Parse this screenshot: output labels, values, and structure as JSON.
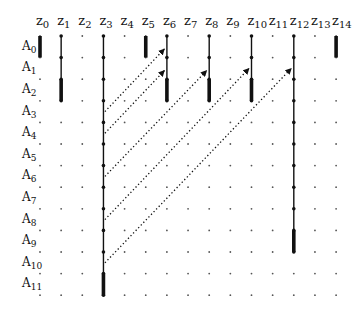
{
  "columns": [
    "z0",
    "z1",
    "z2",
    "z3",
    "z4",
    "z5",
    "z6",
    "z7",
    "z8",
    "z9",
    "z10",
    "z11",
    "z12",
    "z13",
    "z14"
  ],
  "rows": [
    "A0",
    "A1",
    "A2",
    "A3",
    "A4",
    "A5",
    "A6",
    "A7",
    "A8",
    "A9",
    "A10",
    "A11"
  ],
  "layout": {
    "x0": 40,
    "dx": 21.15,
    "y0": 36,
    "dy": 21.6,
    "header_y": 25,
    "row_label_x": 22
  },
  "vertical_lines": [
    {
      "col": 0,
      "thin": null,
      "thick": [
        0,
        1
      ]
    },
    {
      "col": 1,
      "thin": [
        0,
        3
      ],
      "thick": [
        2,
        3
      ]
    },
    {
      "col": 3,
      "thin": [
        0,
        12
      ],
      "thick": [
        11,
        12
      ]
    },
    {
      "col": 5,
      "thin": null,
      "thick": [
        0,
        1
      ]
    },
    {
      "col": 6,
      "thin": [
        0,
        3
      ],
      "thick": [
        2,
        3
      ]
    },
    {
      "col": 8,
      "thin": [
        0,
        3
      ],
      "thick": [
        2,
        3
      ]
    },
    {
      "col": 10,
      "thin": [
        0,
        3
      ],
      "thick": [
        2,
        3
      ]
    },
    {
      "col": 12,
      "thin": [
        0,
        10
      ],
      "thick": [
        9,
        10
      ]
    },
    {
      "col": 14,
      "thin": null,
      "thick": [
        0,
        1
      ]
    }
  ],
  "arrows": [
    {
      "from_col": 3,
      "from_row": 3.5,
      "to_col": 6,
      "to_row": 0.6
    },
    {
      "from_col": 3,
      "from_row": 4.5,
      "to_col": 6,
      "to_row": 1.6
    },
    {
      "from_col": 3,
      "from_row": 6.5,
      "to_col": 8,
      "to_row": 1.6
    },
    {
      "from_col": 3,
      "from_row": 8.5,
      "to_col": 10,
      "to_row": 1.5
    },
    {
      "from_col": 3,
      "from_row": 10.5,
      "to_col": 12,
      "to_row": 1.5
    }
  ],
  "colors": {
    "ink": "#111111",
    "dot": "#555555"
  }
}
